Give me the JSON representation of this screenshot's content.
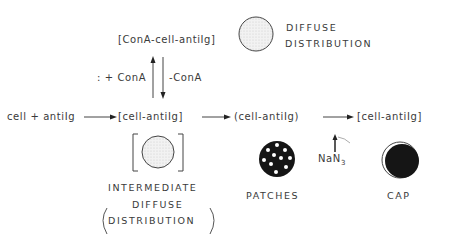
{
  "labels": {
    "top_complex": "[ConA-cell-antiIg]",
    "diffuse_top": "DIFFUSE",
    "distribution_top": "DISTRIBUTION",
    "plus_cona": ": + ConA",
    "minus_cona": "-ConA",
    "reactants": "cell + antiIg",
    "complex1": "[cell-antiIg]",
    "complex2": "(cell-antiIg)",
    "complex3": "[cell-antiIg]",
    "inhibitor": "NaN",
    "inhibitor_sub": "3",
    "intermediate": "INTERMEDIATE",
    "diffuse_mid": "DIFFUSE",
    "distribution_mid": "DISTRIBUTION",
    "patches": "PATCHES",
    "cap": "CAP"
  }
}
